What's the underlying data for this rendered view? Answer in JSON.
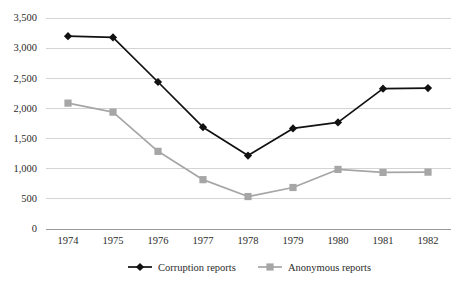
{
  "chart_data": {
    "type": "line",
    "title": "",
    "subtitle": "",
    "xlabel": "",
    "ylabel": "",
    "categories": [
      "1974",
      "1975",
      "1976",
      "1977",
      "1978",
      "1979",
      "1980",
      "1981",
      "1982"
    ],
    "series": [
      {
        "name": "Corruption reports",
        "color": "#111111",
        "marker": "diamond",
        "values": [
          3190,
          3170,
          2430,
          1680,
          1210,
          1660,
          1760,
          2320,
          2330
        ]
      },
      {
        "name": "Anonymous reports",
        "color": "#a6a6a6",
        "marker": "square",
        "values": [
          2080,
          1930,
          1280,
          810,
          530,
          680,
          980,
          930,
          935
        ]
      }
    ],
    "ylim": [
      0,
      3500
    ],
    "ytick_values": [
      0,
      500,
      1000,
      1500,
      2000,
      2500,
      3000,
      3500
    ],
    "ytick_labels": [
      "0",
      "500",
      "1,000",
      "1,500",
      "2,000",
      "2,500",
      "3,000",
      "3,500"
    ],
    "xtick_labels": [
      "1974",
      "1975",
      "1976",
      "1977",
      "1978",
      "1979",
      "1980",
      "1981",
      "1982"
    ],
    "grid": "horizontal",
    "grid_color": "#d4d4d4",
    "legend_position": "bottom-center",
    "legend_entries": [
      "Corruption reports",
      "Anonymous reports"
    ],
    "background": "#ffffff"
  }
}
